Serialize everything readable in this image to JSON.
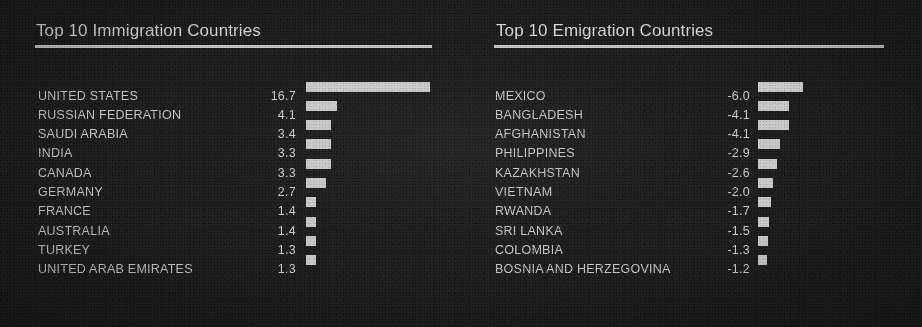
{
  "chart_data": [
    {
      "type": "bar",
      "title": "Top 10 Immigration Countries",
      "orientation": "horizontal",
      "xlabel": "",
      "ylabel": "",
      "grid": false,
      "legend": false,
      "unit_hint": "millions of migrants",
      "px_per_unit": 7.45,
      "categories": [
        "UNITED STATES",
        "RUSSIAN FEDERATION",
        "SAUDI ARABIA",
        "INDIA",
        "CANADA",
        "GERMANY",
        "FRANCE",
        "AUSTRALIA",
        "TURKEY",
        "UNITED ARAB EMIRATES"
      ],
      "values": [
        16.7,
        4.1,
        3.4,
        3.3,
        3.3,
        2.7,
        1.4,
        1.4,
        1.3,
        1.3
      ],
      "value_labels": [
        "16.7",
        "4.1",
        "3.4",
        "3.3",
        "3.3",
        "2.7",
        "1.4",
        "1.4",
        "1.3",
        "1.3"
      ],
      "xlim": [
        0,
        16.7
      ]
    },
    {
      "type": "bar",
      "title": "Top 10 Emigration Countries",
      "orientation": "horizontal",
      "xlabel": "",
      "ylabel": "",
      "grid": false,
      "legend": false,
      "unit_hint": "millions of migrants",
      "px_per_unit": 7.45,
      "categories": [
        "MEXICO",
        "BANGLADESH",
        "AFGHANISTAN",
        "PHILIPPINES",
        "KAZAKHSTAN",
        "VIETNAM",
        "RWANDA",
        "SRI LANKA",
        "COLOMBIA",
        "BOSNIA AND HERZEGOVINA"
      ],
      "values": [
        -6.0,
        -4.1,
        -4.1,
        -2.9,
        -2.6,
        -2.0,
        -1.7,
        -1.5,
        -1.3,
        -1.2
      ],
      "value_labels": [
        "-6.0",
        "-4.1",
        "-4.1",
        "-2.9",
        "-2.6",
        "-2.0",
        "-1.7",
        "-1.5",
        "-1.3",
        "-1.2"
      ],
      "xlim": [
        -6.0,
        0
      ]
    }
  ],
  "colors": {
    "background": "#202020",
    "bar": "#c9c9c9",
    "title_text": "#d9d9d9",
    "label_text": "#c9c9c9",
    "rule": "#c4c4c4"
  }
}
